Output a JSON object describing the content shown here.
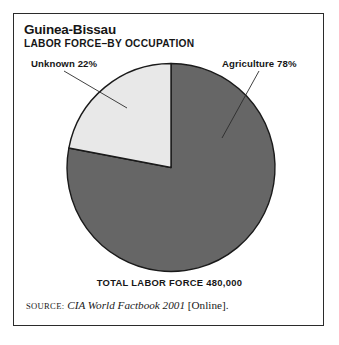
{
  "figure": {
    "title": "Guinea-Bissau",
    "subtitle": "LABOR FORCE–BY OCCUPATION",
    "total_caption": "TOTAL LABOR FORCE 480,000",
    "source": {
      "kicker": "SOURCE:",
      "work": "CIA World Factbook 2001",
      "suffix": "[Online]."
    }
  },
  "colors": {
    "frame": "#2b2b2b",
    "text": "#161616",
    "slice_dark": "#666666",
    "slice_light": "#e8e8e8",
    "slice_outline": "#1a1a1a",
    "leader_line": "#2b2b2b",
    "background": "#ffffff"
  },
  "labels": {
    "unknown": "Unknown 22%",
    "agriculture": "Agriculture 78%"
  },
  "chart_data": {
    "type": "pie",
    "title": "Guinea-Bissau",
    "subtitle": "LABOR FORCE–BY OCCUPATION",
    "categories": [
      "Agriculture",
      "Unknown"
    ],
    "values": [
      78,
      22
    ],
    "unit": "percent",
    "data_labels": [
      "Agriculture 78%",
      "Unknown 22%"
    ],
    "slice_colors": [
      "#666666",
      "#e8e8e8"
    ],
    "start_angle_deg": 0,
    "direction": "clockwise",
    "total_label": "TOTAL LABOR FORCE 480,000",
    "total_value": 480000,
    "legend": "none",
    "grid": false,
    "annotations": [
      "SOURCE: CIA World Factbook 2001 [Online]."
    ]
  }
}
